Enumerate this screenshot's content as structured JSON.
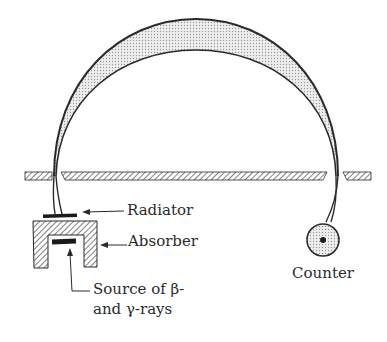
{
  "diagram": {
    "type": "beta-gamma spectrometer schematic",
    "labels": {
      "radiator": "Radiator",
      "absorber": "Absorber",
      "source_line1": "Source of β-",
      "source_line2": "and γ-rays",
      "counter": "Counter"
    },
    "colors": {
      "ink": "#2a2a2a",
      "shading": "#d8d8d8",
      "background": "#ffffff"
    }
  }
}
